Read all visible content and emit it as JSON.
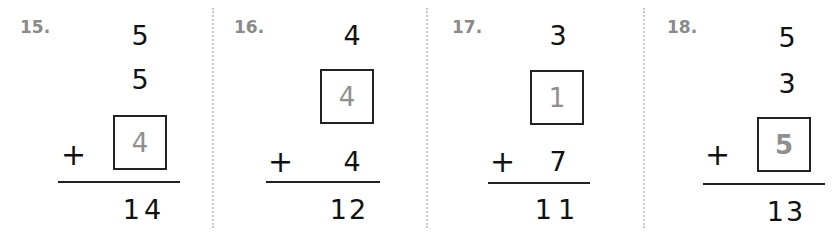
{
  "problems": [
    {
      "number": "15.",
      "rows": [
        "5",
        "5",
        "4"
      ],
      "answer_row": 2,
      "operator": "+",
      "sum": "14"
    },
    {
      "number": "16.",
      "rows": [
        "4",
        "4",
        "4"
      ],
      "answer_row": 1,
      "operator": "+",
      "sum": "12"
    },
    {
      "number": "17.",
      "rows": [
        "3",
        "1",
        "7"
      ],
      "answer_row": 1,
      "operator": "+",
      "sum": "11"
    },
    {
      "number": "18.",
      "rows": [
        "5",
        "3",
        "5"
      ],
      "answer_row": 2,
      "operator": "+",
      "sum": "13"
    }
  ],
  "colors": {
    "label": "#8a8a8a",
    "answer": "#8f8f8f",
    "ink": "#111111",
    "separator": "#c8c8c8"
  }
}
